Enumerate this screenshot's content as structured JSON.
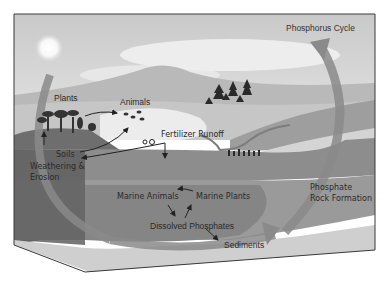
{
  "diagram": {
    "title": "Phosphorus Cycle",
    "labels": {
      "plants": "Plants",
      "animals": "Animals",
      "fertilizer_runoff": "Fertilizer Runoff",
      "soils": "Soils",
      "weathering_1": "Weathering &",
      "weathering_2": "Erosion",
      "marine_animals": "Marine Animals",
      "marine_plants": "Marine Plants",
      "dissolved_phosphates": "Dissolved Phosphates",
      "sediments": "Sediments",
      "phosphate_rock_1": "Phosphate",
      "phosphate_rock_2": "Rock Formation"
    },
    "colors": {
      "sky": "#d9d9d9",
      "sun": "#f4f4f4",
      "mountain": "#bdbdbd",
      "land": "#b5b5b5",
      "soil": "#6e6e6e",
      "water": "#8a8a8a",
      "deep_water": "#7a7a7a",
      "cycle_arrow": "#8c8c8c",
      "text": "#2a2a2a"
    }
  }
}
